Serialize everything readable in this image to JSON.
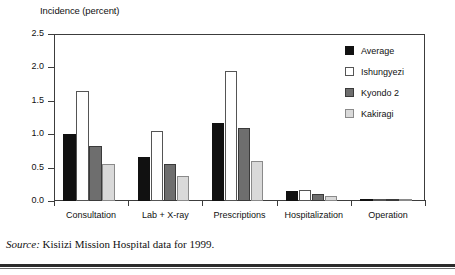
{
  "chart_data": {
    "type": "bar",
    "title": "Incidence (percent)",
    "xlabel": "",
    "ylabel": "Incidence (percent)",
    "ylim": [
      0.0,
      2.5
    ],
    "yticks": [
      "0.0",
      "0.5",
      "1.0",
      "1.5",
      "2.0",
      "2.5"
    ],
    "grid": false,
    "legend_position": "top-right",
    "categories": [
      "Consultation",
      "Lab + X-ray",
      "Prescriptions",
      "Hospitalization",
      "Operation"
    ],
    "series": [
      {
        "name": "Average",
        "color": "#111111",
        "values": [
          1.0,
          0.66,
          1.17,
          0.15,
          0.02
        ]
      },
      {
        "name": "Ishungyezi",
        "color": "#ffffff",
        "values": [
          1.64,
          1.05,
          1.94,
          0.16,
          0.02
        ]
      },
      {
        "name": "Kyondo 2",
        "color": "#6e6e6e",
        "values": [
          0.83,
          0.56,
          1.09,
          0.11,
          0.02
        ]
      },
      {
        "name": "Kakiragi",
        "color": "#d9d9d9",
        "values": [
          0.55,
          0.38,
          0.6,
          0.07,
          0.01
        ]
      }
    ]
  },
  "legend": {
    "items": [
      {
        "label": "Average",
        "swatch": "legend-swatch-average"
      },
      {
        "label": "Ishungyezi",
        "swatch": "legend-swatch-ishungyezi"
      },
      {
        "label": "Kyondo 2",
        "swatch": "legend-swatch-kyondo-2"
      },
      {
        "label": "Kakiragi",
        "swatch": "legend-swatch-kakiragi"
      }
    ]
  },
  "source": {
    "lead": "Source:",
    "text": " Kisiizi Mission Hospital data for 1999."
  }
}
